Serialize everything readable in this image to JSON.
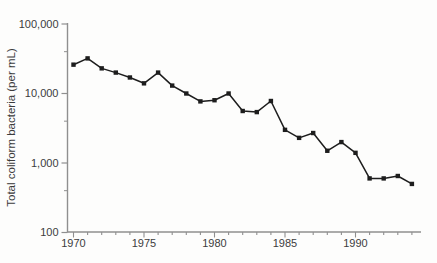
{
  "figure": {
    "background": "#fdfdfc",
    "line_color": "#1d1d1d",
    "marker_color": "#1d1d1d",
    "axis_color": "#8f8f8f",
    "label_color": "#3c3c3c"
  },
  "chart_data": {
    "type": "line",
    "title": "",
    "xlabel": "",
    "ylabel": "Total coliform bacteria (per mL)",
    "y_scale": "log",
    "grid": false,
    "legend": "none",
    "marker": "square",
    "series_name": "Total coliform bacteria",
    "x": [
      1970,
      1971,
      1972,
      1973,
      1974,
      1975,
      1976,
      1977,
      1978,
      1979,
      1980,
      1981,
      1982,
      1983,
      1984,
      1985,
      1986,
      1987,
      1988,
      1989,
      1990,
      1991,
      1992,
      1993,
      1994
    ],
    "values": [
      26000,
      32000,
      23000,
      20000,
      17000,
      14000,
      20000,
      13000,
      10000,
      7700,
      8000,
      10000,
      5600,
      5400,
      7800,
      3000,
      2300,
      2700,
      1500,
      2000,
      1400,
      600,
      600,
      650,
      500
    ],
    "xlim": [
      1969.5,
      1994.7
    ],
    "ylim": [
      100,
      100000
    ],
    "y_tick_values": [
      100000,
      10000,
      1000,
      100
    ],
    "y_tick_labels": [
      "100,000",
      "10,000",
      "1,000",
      "100"
    ],
    "y_minor_tick_values": [
      40000,
      4000,
      400
    ],
    "x_tick_values": [
      1970,
      1975,
      1980,
      1985,
      1990
    ],
    "x_tick_labels": [
      "1970",
      "1975",
      "1980",
      "1985",
      "1990"
    ],
    "x_minor_tick_years_start": 1970,
    "x_minor_tick_years_end": 1994
  }
}
